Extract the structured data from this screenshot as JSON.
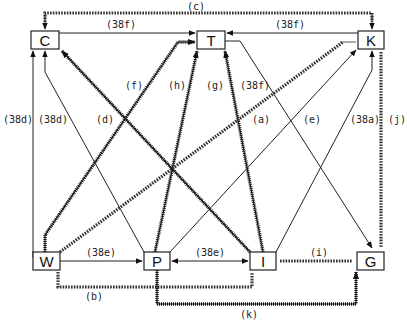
{
  "diagram": {
    "nodes": [
      {
        "id": "C",
        "label": "C",
        "x": 31,
        "y": 31,
        "w": 28,
        "h": 18
      },
      {
        "id": "T",
        "label": "T",
        "x": 197,
        "y": 31,
        "w": 28,
        "h": 18
      },
      {
        "id": "K",
        "label": "K",
        "x": 358,
        "y": 31,
        "w": 26,
        "h": 18
      },
      {
        "id": "W",
        "label": "W",
        "x": 33,
        "y": 252,
        "w": 27,
        "h": 18
      },
      {
        "id": "P",
        "label": "P",
        "x": 144,
        "y": 252,
        "w": 26,
        "h": 18
      },
      {
        "id": "I",
        "label": "I",
        "x": 250,
        "y": 252,
        "w": 26,
        "h": 18
      },
      {
        "id": "G",
        "label": "G",
        "x": 357,
        "y": 252,
        "w": 27,
        "h": 18
      }
    ],
    "edge_labels": {
      "c": "(c)",
      "f38_CT": "(38f)",
      "f38_KT": "(38f)",
      "d38_outer": "(38d)",
      "d38_inner": "(38d)",
      "d": "(d)",
      "f": "(f)",
      "h": "(h)",
      "g": "(g)",
      "f38_mid": "(38f)",
      "a": "(a)",
      "e": "(e)",
      "a38": "(38a)",
      "j": "(j)",
      "e38_WP": "(38e)",
      "e38_PI": "(38e)",
      "i": "(i)",
      "b": "(b)",
      "k": "(k)"
    },
    "edges": [
      {
        "from": "T",
        "to": "C",
        "label": "(c)",
        "style": "x-marked"
      },
      {
        "from": "C",
        "to": "T",
        "label": "(38f)",
        "style": "plain"
      },
      {
        "from": "K",
        "to": "T",
        "label": "(38f)",
        "style": "plain"
      },
      {
        "from": "W",
        "to": "C",
        "label": "(38d)",
        "style": "plain"
      },
      {
        "from": "P",
        "to": "C",
        "label": "(38d)",
        "style": "plain"
      },
      {
        "from": "I",
        "to": "C",
        "label": "(d)",
        "style": "hatched"
      },
      {
        "from": "W",
        "to": "T",
        "label": "(f)",
        "style": "hatched"
      },
      {
        "from": "P",
        "to": "T",
        "label": "(h)",
        "style": "hatched"
      },
      {
        "from": "I",
        "to": "T",
        "label": "(g)",
        "style": "hatched"
      },
      {
        "from": "T",
        "to": "G",
        "label": "(38f)",
        "style": "plain"
      },
      {
        "from": "W",
        "to": "K",
        "label": "(a)",
        "style": "x-marked"
      },
      {
        "from": "P",
        "to": "K",
        "label": "(e)",
        "style": "plain"
      },
      {
        "from": "I",
        "to": "K",
        "label": "(38a)",
        "style": "plain"
      },
      {
        "from": "K",
        "to": "G",
        "label": "(j)",
        "style": "x-marked"
      },
      {
        "from": "W",
        "to": "P",
        "label": "(38e)",
        "style": "plain"
      },
      {
        "from": "P",
        "to": "I",
        "label": "(38e)",
        "style": "plain-bidirectional"
      },
      {
        "from": "I",
        "to": "G",
        "label": "(i)",
        "style": "x-marked"
      },
      {
        "from": "W",
        "to": "I",
        "label": "(b)",
        "style": "x-marked"
      },
      {
        "from": "P",
        "to": "G",
        "label": "(k)",
        "style": "hatched"
      }
    ]
  }
}
